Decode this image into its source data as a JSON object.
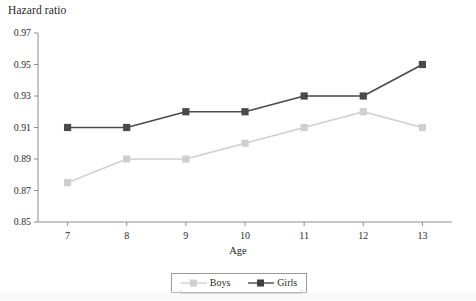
{
  "chart_data": {
    "type": "line",
    "title": "",
    "xlabel": "Age",
    "ylabel": "Hazard ratio",
    "categories": [
      7,
      8,
      9,
      10,
      11,
      12,
      13
    ],
    "x": [
      7,
      8,
      9,
      10,
      11,
      12,
      13
    ],
    "xlim": [
      6.5,
      13.5
    ],
    "ylim": [
      0.85,
      0.97
    ],
    "ytick_labels": [
      "0.97",
      "0.95",
      "0.93",
      "0.91",
      "0.89",
      "0.87",
      "0.85"
    ],
    "ytick_values": [
      0.97,
      0.95,
      0.93,
      0.91,
      0.89,
      0.87,
      0.85
    ],
    "xtick_labels": [
      "7",
      "8",
      "9",
      "10",
      "11",
      "12",
      "13"
    ],
    "grid": false,
    "legend_position": "bottom-center",
    "series": [
      {
        "name": "Boys",
        "color": "#cfcfcf",
        "marker": "square",
        "values": [
          0.875,
          0.89,
          0.89,
          0.9,
          0.91,
          0.92,
          0.91
        ]
      },
      {
        "name": "Girls",
        "color": "#4a4a4a",
        "marker": "square",
        "values": [
          0.91,
          0.91,
          0.92,
          0.92,
          0.93,
          0.93,
          0.95
        ]
      }
    ]
  },
  "axes": {
    "y_title": "Hazard ratio",
    "x_title": "Age"
  },
  "legend": {
    "items": [
      {
        "label": "Boys"
      },
      {
        "label": "Girls"
      }
    ]
  },
  "colors": {
    "boys": "#cfcfcf",
    "girls": "#4a4a4a",
    "axis": "#8c8c8c",
    "text": "#2b2b2b"
  }
}
